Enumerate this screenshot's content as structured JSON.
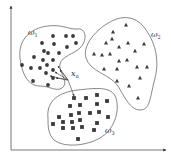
{
  "diagram": {
    "type": "knn-classification-illustration",
    "colors": {
      "stroke": "#555555",
      "marker": "#3a3a3a",
      "axis": "#555555",
      "background": "#ffffff"
    },
    "axes": {
      "origin": [
        11,
        150
      ],
      "x_end": [
        166,
        150
      ],
      "y_end": [
        11,
        6
      ]
    },
    "query_point": {
      "label": "x",
      "subscript": "n",
      "position": [
        68,
        80
      ],
      "label_position": [
        71,
        76
      ]
    },
    "classes": [
      {
        "name": "ω1",
        "symbol": "ω",
        "subscript": "1",
        "marker": "circle",
        "label_position": [
          28,
          35
        ],
        "boundary": "M20,58 C18,40 30,28 48,26 C62,24 70,30 78,29 C86,28 88,40 80,48 C74,54 62,56 60,64 C58,72 70,82 62,88 C56,92 50,86 40,86 C28,86 22,74 20,58 Z",
        "points": [
          [
            42,
            43
          ],
          [
            53,
            36
          ],
          [
            66,
            36
          ],
          [
            73,
            36
          ],
          [
            44,
            51
          ],
          [
            54,
            44
          ],
          [
            67,
            47
          ],
          [
            76,
            43
          ],
          [
            34,
            57
          ],
          [
            48,
            53
          ],
          [
            59,
            53
          ],
          [
            43,
            60
          ],
          [
            53,
            60
          ],
          [
            22,
            65
          ],
          [
            31,
            68
          ],
          [
            40,
            68
          ],
          [
            47,
            65
          ],
          [
            53,
            70
          ],
          [
            33,
            81
          ],
          [
            46,
            73
          ],
          [
            53,
            78
          ],
          [
            48,
            85
          ]
        ]
      },
      {
        "name": "ω2",
        "symbol": "ω",
        "subscript": "2",
        "marker": "triangle",
        "label_position": [
          151,
          37
        ],
        "boundary": "M86,58 C82,46 96,28 114,20 C128,14 140,20 146,30 C156,44 160,62 154,82 C150,98 150,110 140,110 C130,110 124,96 118,86 C110,74 90,72 86,58 Z",
        "points": [
          [
            126,
            25
          ],
          [
            113,
            32
          ],
          [
            106,
            43
          ],
          [
            112,
            39
          ],
          [
            119,
            47
          ],
          [
            128,
            43
          ],
          [
            135,
            51
          ],
          [
            144,
            44
          ],
          [
            94,
            54
          ],
          [
            102,
            55
          ],
          [
            110,
            54
          ],
          [
            119,
            61
          ],
          [
            127,
            60
          ],
          [
            104,
            69
          ],
          [
            117,
            69
          ],
          [
            137,
            67
          ],
          [
            147,
            67
          ],
          [
            117,
            81
          ],
          [
            129,
            86
          ],
          [
            140,
            78
          ],
          [
            138,
            98
          ]
        ]
      },
      {
        "name": "ω3",
        "symbol": "ω",
        "subscript": "3",
        "marker": "square",
        "label_position": [
          105,
          133
        ],
        "boundary": "M48,118 C46,100 60,92 78,90 C96,88 112,86 116,98 C120,112 114,130 100,138 C86,146 64,148 54,140 C48,134 48,126 48,118 Z",
        "points": [
          [
            74,
            98
          ],
          [
            86,
            98
          ],
          [
            97,
            95
          ],
          [
            70,
            106
          ],
          [
            80,
            105
          ],
          [
            97,
            104
          ],
          [
            107,
            101
          ],
          [
            90,
            113
          ],
          [
            99,
            112
          ],
          [
            59,
            117
          ],
          [
            71,
            115
          ],
          [
            79,
            113
          ],
          [
            108,
            117
          ],
          [
            53,
            124
          ],
          [
            63,
            122
          ],
          [
            72,
            122
          ],
          [
            80,
            120
          ],
          [
            97,
            123
          ],
          [
            63,
            128
          ],
          [
            73,
            128
          ],
          [
            82,
            127
          ],
          [
            94,
            130
          ],
          [
            78,
            139
          ]
        ]
      }
    ],
    "neighbor_links": [
      {
        "from": [
          68,
          80
        ],
        "to": [
          58,
          66
        ]
      },
      {
        "from": [
          68,
          80
        ],
        "to": [
          55,
          72
        ]
      },
      {
        "from": [
          68,
          80
        ],
        "to": [
          50,
          76
        ]
      },
      {
        "from": [
          68,
          80
        ],
        "to": [
          56,
          78
        ]
      },
      {
        "from": [
          68,
          80
        ],
        "to": [
          60,
          70
        ]
      },
      {
        "from": [
          68,
          80
        ],
        "to": [
          74,
          96
        ]
      }
    ]
  }
}
